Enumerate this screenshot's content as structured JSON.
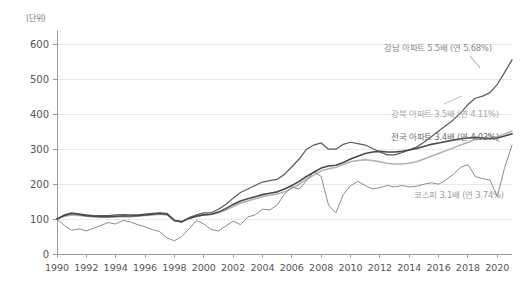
{
  "axes": {
    "unit_label": "(단위)",
    "y_ticks": [
      0,
      100,
      200,
      300,
      400,
      500,
      600
    ],
    "x_ticks": [
      1990,
      1992,
      1994,
      1996,
      1998,
      2000,
      2002,
      2004,
      2006,
      2008,
      2010,
      2012,
      2014,
      2016,
      2018,
      2020
    ]
  },
  "annotations": {
    "gangnam": "강남 아파트 5.5배 (연 5.68%)",
    "gangbuk": "강북 아파트 3.5배 (연 4.11%)",
    "nationwide": "전국 아파트 3.4배 (연 4.03%)",
    "kospi": "코스피 3.1배 (연 3.74%)"
  },
  "colors": {
    "gangnam": "#5c5c5c",
    "gangbuk": "#b0b0b0",
    "nationwide": "#4a4a4a",
    "kospi": "#8c8c8c",
    "grid": "#e9e9e9",
    "axis": "#9a9a9a",
    "background": "#ffffff"
  },
  "chart_data": {
    "type": "line",
    "title": "",
    "xlabel": "",
    "ylabel": "",
    "unit": "(단위)",
    "xlim": [
      1990,
      2021
    ],
    "ylim": [
      0,
      630
    ],
    "grid": true,
    "legend": "inline annotations at right of each series",
    "x": [
      1990,
      1990.5,
      1991,
      1991.5,
      1992,
      1992.5,
      1993,
      1993.5,
      1994,
      1994.5,
      1995,
      1995.5,
      1996,
      1996.5,
      1997,
      1997.5,
      1998,
      1998.5,
      1999,
      1999.5,
      2000,
      2000.5,
      2001,
      2001.5,
      2002,
      2002.5,
      2003,
      2003.5,
      2004,
      2004.5,
      2005,
      2005.5,
      2006,
      2006.5,
      2007,
      2007.5,
      2008,
      2008.5,
      2009,
      2009.5,
      2010,
      2010.5,
      2011,
      2011.5,
      2012,
      2012.5,
      2013,
      2013.5,
      2014,
      2014.5,
      2015,
      2015.5,
      2016,
      2016.5,
      2017,
      2017.5,
      2018,
      2018.5,
      2019,
      2019.5,
      2020,
      2020.5,
      2021
    ],
    "series": [
      {
        "name": "강남 아파트",
        "label": "강남 아파트 5.5배 (연 5.68%)",
        "multiple": 5.5,
        "cagr_percent": 5.68,
        "color": "#5c5c5c",
        "values": [
          100,
          112,
          118,
          115,
          112,
          110,
          110,
          110,
          112,
          113,
          112,
          112,
          114,
          116,
          118,
          116,
          96,
          92,
          104,
          112,
          118,
          118,
          128,
          142,
          160,
          176,
          186,
          196,
          206,
          210,
          214,
          228,
          250,
          272,
          300,
          312,
          318,
          300,
          300,
          314,
          320,
          316,
          312,
          302,
          292,
          284,
          284,
          290,
          298,
          306,
          320,
          336,
          352,
          368,
          384,
          404,
          428,
          446,
          452,
          462,
          486,
          520,
          556
        ]
      },
      {
        "name": "강북 아파트",
        "label": "강북 아파트 3.5배 (연 4.11%)",
        "multiple": 3.5,
        "cagr_percent": 4.11,
        "color": "#b0b0b0",
        "values": [
          100,
          108,
          112,
          110,
          108,
          106,
          105,
          105,
          106,
          107,
          107,
          108,
          110,
          112,
          114,
          112,
          96,
          93,
          102,
          108,
          112,
          113,
          118,
          126,
          136,
          146,
          152,
          158,
          164,
          168,
          172,
          178,
          188,
          200,
          214,
          226,
          238,
          244,
          248,
          256,
          264,
          268,
          270,
          268,
          264,
          260,
          258,
          258,
          260,
          264,
          272,
          280,
          288,
          296,
          304,
          312,
          320,
          328,
          330,
          332,
          336,
          344,
          352
        ]
      },
      {
        "name": "전국 아파트",
        "label": "전국 아파트 3.4배 (연 4.03%)",
        "multiple": 3.4,
        "cagr_percent": 4.03,
        "color": "#4a4a4a",
        "values": [
          100,
          110,
          116,
          113,
          110,
          108,
          107,
          107,
          108,
          109,
          109,
          110,
          112,
          114,
          116,
          114,
          96,
          92,
          102,
          108,
          112,
          114,
          120,
          130,
          142,
          152,
          158,
          164,
          170,
          174,
          178,
          186,
          196,
          208,
          222,
          234,
          246,
          252,
          254,
          262,
          272,
          280,
          288,
          292,
          294,
          292,
          292,
          294,
          298,
          302,
          308,
          314,
          318,
          322,
          326,
          330,
          332,
          334,
          332,
          330,
          332,
          338,
          344
        ]
      },
      {
        "name": "코스피",
        "label": "코스피 3.1배 (연 3.74%)",
        "multiple": 3.1,
        "cagr_percent": 3.74,
        "color": "#8c8c8c",
        "values": [
          100,
          82,
          68,
          72,
          66,
          74,
          82,
          90,
          86,
          96,
          92,
          84,
          78,
          70,
          64,
          46,
          38,
          50,
          72,
          96,
          86,
          70,
          66,
          80,
          94,
          84,
          106,
          112,
          128,
          126,
          140,
          172,
          192,
          186,
          210,
          236,
          222,
          140,
          118,
          170,
          196,
          208,
          196,
          186,
          190,
          196,
          192,
          196,
          192,
          194,
          200,
          204,
          200,
          212,
          228,
          248,
          256,
          222,
          216,
          212,
          164,
          248,
          312
        ]
      }
    ]
  }
}
